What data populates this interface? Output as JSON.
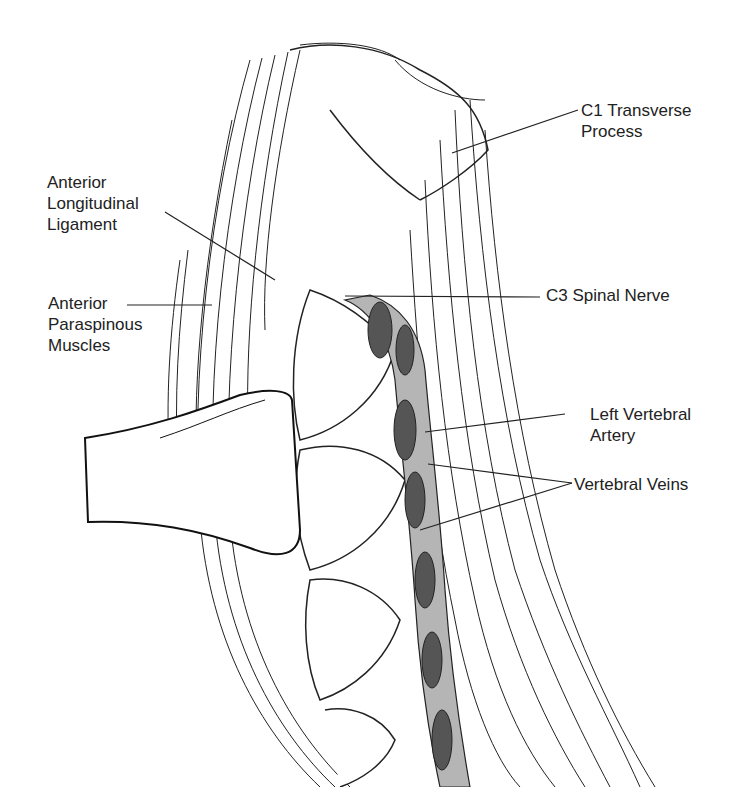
{
  "figure": {
    "colors": {
      "ink": "#1a1a1a",
      "vessel_dark": "#555555",
      "vessel_light": "#b5b5b5",
      "background": "#ffffff"
    },
    "labels": [
      {
        "id": "c1-transverse-process",
        "text": "C1 Transverse\nProcess",
        "side": "right"
      },
      {
        "id": "anterior-longitudinal-ligament",
        "text": "Anterior\nLongitudinal\nLigament",
        "side": "left"
      },
      {
        "id": "anterior-paraspinous-muscles",
        "text": "Anterior\nParaspinous\nMuscles",
        "side": "left"
      },
      {
        "id": "c3-spinal-nerve",
        "text": "C3 Spinal Nerve",
        "side": "right"
      },
      {
        "id": "left-vertebral-artery",
        "text": "Left Vertebral\nArtery",
        "side": "right"
      },
      {
        "id": "vertebral-veins",
        "text": "Vertebral Veins",
        "side": "right"
      }
    ]
  }
}
